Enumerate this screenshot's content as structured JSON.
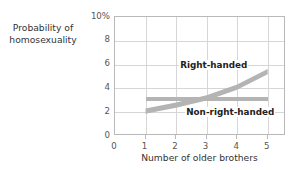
{
  "chart_data": {
    "type": "line",
    "title": "",
    "xlabel": "Number of older brothers",
    "ylabel": "Probability of homosexuality",
    "ylabel_line1": "Probability of",
    "ylabel_line2": "homosexuality",
    "xlim": [
      0,
      5.6
    ],
    "ylim": [
      0,
      10
    ],
    "xticks": [
      0,
      1,
      2,
      3,
      4,
      5
    ],
    "xticklabels": [
      "0",
      "1",
      "2",
      "3",
      "4",
      "5"
    ],
    "yticks": [
      0,
      2,
      4,
      6,
      8,
      10
    ],
    "yticklabels": [
      "0",
      "2",
      "4",
      "6",
      "8",
      "10%"
    ],
    "grid": true,
    "gridlines_y": [
      2,
      4,
      6,
      8
    ],
    "gridlines_x": [
      1,
      2,
      3,
      4,
      5
    ],
    "legend_position": "inline-annotations",
    "band_color": "#b4b4b4",
    "grid_color": "#d6d6d6",
    "frame_color": "#b9b9b9",
    "series": [
      {
        "name": "Right-handed",
        "style": "band",
        "x": [
          1,
          2,
          3,
          4,
          5
        ],
        "values": [
          2.1,
          2.6,
          3.2,
          4.1,
          5.4
        ],
        "band_halfwidth": 0.22,
        "annotation": "Right-handed"
      },
      {
        "name": "Non-right-handed",
        "style": "band",
        "x": [
          1,
          2,
          3,
          4,
          5
        ],
        "values": [
          3.1,
          3.1,
          3.1,
          3.1,
          3.1
        ],
        "band_halfwidth": 0.18,
        "annotation": "Non-right-handed"
      }
    ]
  },
  "annotations": {
    "right_handed": "Right-handed",
    "non_right_handed": "Non-right-handed"
  }
}
